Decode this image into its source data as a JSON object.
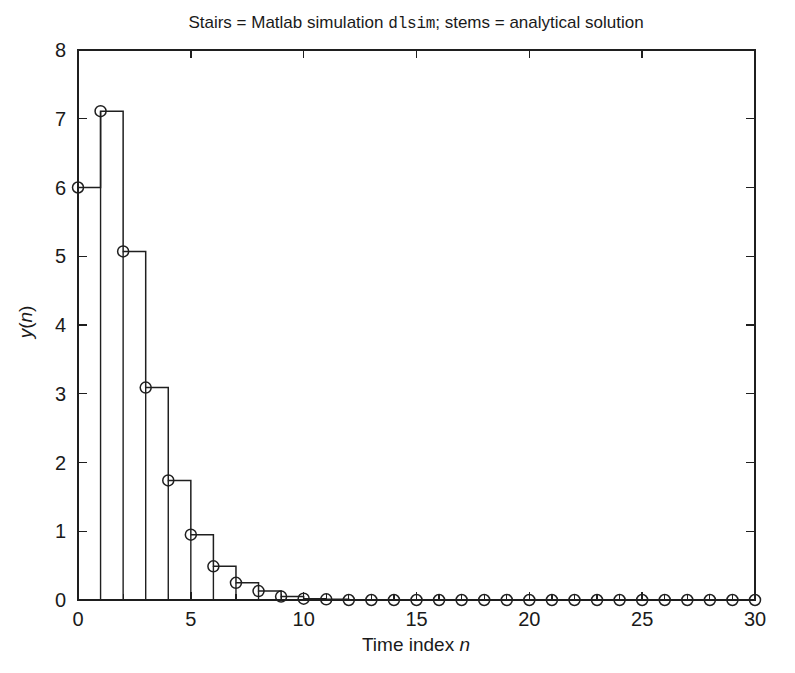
{
  "figure": {
    "background_color": "#ffffff",
    "line_color": "#1f1f1f",
    "title_prefix": "Stairs = Matlab simulation ",
    "title_mono": "dlsim",
    "title_suffix": "; stems = analytical solution",
    "title_full": "Stairs = Matlab simulation dlsim; stems = analytical solution"
  },
  "chart_data": {
    "type": "line",
    "title": "Stairs = Matlab simulation dlsim; stems = analytical solution",
    "xlabel": "Time index n",
    "ylabel": "y(n)",
    "xlim": [
      0,
      30
    ],
    "ylim": [
      0,
      8
    ],
    "grid": false,
    "legend": null,
    "xticks": [
      0,
      5,
      10,
      15,
      20,
      25,
      30
    ],
    "xtick_labels": [
      "0",
      "5",
      "10",
      "15",
      "20",
      "25",
      "30"
    ],
    "x_minor_tick_step": 1,
    "yticks": [
      0,
      1,
      2,
      3,
      4,
      5,
      6,
      7,
      8
    ],
    "ytick_labels": [
      "0",
      "1",
      "2",
      "3",
      "4",
      "5",
      "6",
      "7",
      "8"
    ],
    "x": [
      0,
      1,
      2,
      3,
      4,
      5,
      6,
      7,
      8,
      9,
      10,
      11,
      12,
      13,
      14,
      15,
      16,
      17,
      18,
      19,
      20,
      21,
      22,
      23,
      24,
      25,
      26,
      27,
      28,
      29,
      30
    ],
    "series": [
      {
        "name": "Stairs = Matlab simulation dlsim",
        "style": "stairs",
        "marker": "none",
        "values": [
          6.0,
          7.11,
          5.07,
          3.09,
          1.74,
          0.95,
          0.49,
          0.25,
          0.13,
          0.05,
          0.02,
          0.01,
          0.0,
          0.0,
          0.0,
          0.0,
          0.0,
          0.0,
          0.0,
          0.0,
          0.0,
          0.0,
          0.0,
          0.0,
          0.0,
          0.0,
          0.0,
          0.0,
          0.0,
          0.0,
          0.0
        ]
      },
      {
        "name": "stems = analytical solution",
        "style": "stem",
        "marker": "circle-open",
        "values": [
          6.0,
          7.11,
          5.07,
          3.09,
          1.74,
          0.95,
          0.49,
          0.25,
          0.13,
          0.05,
          0.02,
          0.01,
          0.0,
          0.0,
          0.0,
          0.0,
          0.0,
          0.0,
          0.0,
          0.0,
          0.0,
          0.0,
          0.0,
          0.0,
          0.0,
          0.0,
          0.0,
          0.0,
          0.0,
          0.0,
          0.0
        ]
      }
    ]
  }
}
